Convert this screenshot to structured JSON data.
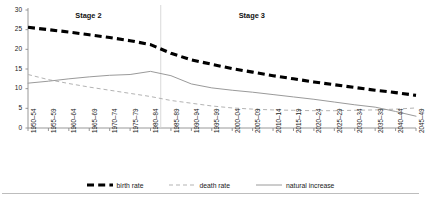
{
  "chart_data": {
    "type": "line",
    "title": "",
    "subtitle": "",
    "xlabel": "",
    "ylabel": "",
    "ylim": [
      0,
      30
    ],
    "yticks": [
      0,
      5,
      10,
      15,
      20,
      25,
      30
    ],
    "grid": false,
    "legend_position": "bottom",
    "categories": [
      "1950–54",
      "1955–59",
      "1960–64",
      "1965–69",
      "1970–74",
      "1975–79",
      "1980–84",
      "1985–89",
      "1990–94",
      "1995–99",
      "2000–04",
      "2005–09",
      "2010–14",
      "2015–19",
      "2020–24",
      "2025–29",
      "2030–34",
      "2035–39",
      "2040–44",
      "2045–49"
    ],
    "series": [
      {
        "name": "birth rate",
        "style": "thick-dashed",
        "color": "#000000",
        "values": [
          25.6,
          25.0,
          24.4,
          23.7,
          23.0,
          22.2,
          21.2,
          19.0,
          17.3,
          16.2,
          15.1,
          14.2,
          13.3,
          12.5,
          11.7,
          11.0,
          10.3,
          9.6,
          9.0,
          8.3
        ]
      },
      {
        "name": "death rate",
        "style": "thin-dashed",
        "color": "#b3b3b3",
        "values": [
          13.6,
          12.3,
          11.3,
          10.4,
          9.6,
          8.8,
          8.0,
          7.0,
          6.3,
          5.6,
          5.1,
          4.8,
          4.6,
          4.5,
          4.4,
          4.4,
          4.5,
          4.6,
          4.8,
          5.1
        ]
      },
      {
        "name": "natural increase",
        "style": "thin-solid",
        "color": "#9a9a9a",
        "values": [
          11.4,
          11.9,
          12.5,
          13.0,
          13.4,
          13.6,
          14.4,
          13.3,
          11.2,
          10.2,
          9.6,
          9.1,
          8.5,
          7.9,
          7.3,
          6.6,
          5.9,
          5.3,
          4.2,
          3.0
        ]
      }
    ],
    "annotations": [
      {
        "text": "Stage 2",
        "at_category": "1965–69"
      },
      {
        "text": "Stage 3",
        "at_category": "2005–09"
      }
    ],
    "divider": {
      "after_category": "1980–84"
    }
  },
  "legend": {
    "items": [
      {
        "label": "birth rate",
        "swatch": "thick-dashed-swatch"
      },
      {
        "label": "death rate",
        "swatch": "thin-dashed-swatch"
      },
      {
        "label": "natural increase",
        "swatch": "thin-solid-swatch"
      }
    ]
  }
}
